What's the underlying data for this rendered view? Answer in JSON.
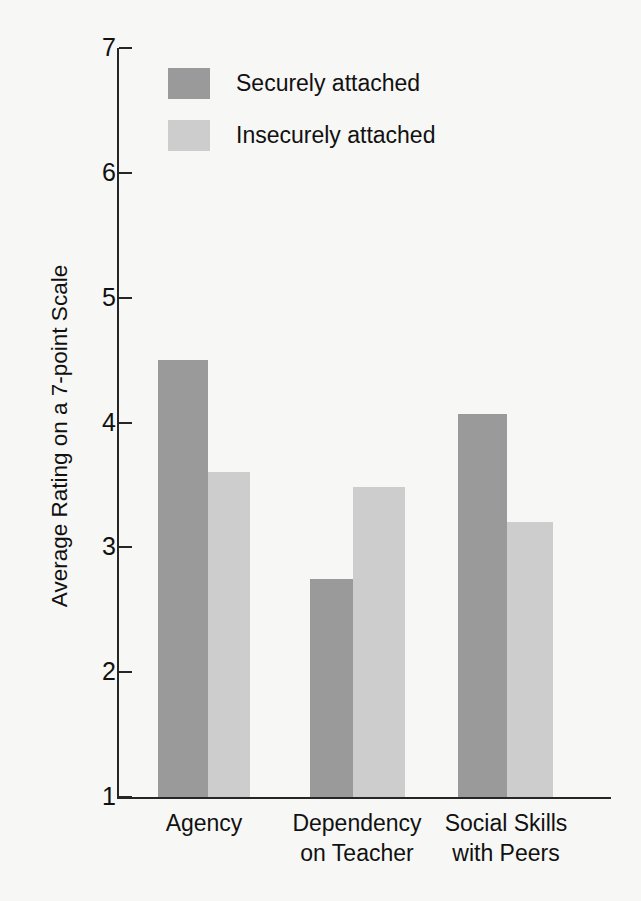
{
  "chart_data": {
    "type": "bar",
    "title": "",
    "xlabel": "",
    "ylabel": "Average Rating on a 7-point Scale",
    "categories": [
      "Agency",
      "Dependency on Teacher",
      "Social Skills with Peers"
    ],
    "category_lines": [
      [
        "Agency",
        ""
      ],
      [
        "Dependency",
        "on Teacher"
      ],
      [
        "Social Skills",
        "with Peers"
      ]
    ],
    "series": [
      {
        "name": "Securely attached",
        "color": "#9a9a9a",
        "values": [
          4.5,
          2.75,
          4.07
        ]
      },
      {
        "name": "Insecurely attached",
        "color": "#cdcdcd",
        "values": [
          3.6,
          3.48,
          3.2
        ]
      }
    ],
    "ylim": [
      1,
      7
    ],
    "yticks": [
      1,
      2,
      3,
      4,
      5,
      6,
      7
    ],
    "ytick_labels": [
      "1",
      "2",
      "3",
      "4",
      "5",
      "6",
      "7"
    ],
    "grid": false,
    "legend_position": "top-left-inside"
  },
  "legend": {
    "items": [
      {
        "label": "Securely attached",
        "swatch": "legend-swatch-secure",
        "color": "#9a9a9a"
      },
      {
        "label": "Insecurely attached",
        "swatch": "legend-swatch-insecure",
        "color": "#cdcdcd"
      }
    ]
  },
  "axes": {
    "y_title": "Average Rating on a 7-point Scale",
    "y_ticks": [
      "7",
      "6",
      "5",
      "4",
      "3",
      "2",
      "1"
    ]
  },
  "colors": {
    "background": "#f7f7f5",
    "axis": "#262626",
    "text": "#111111",
    "series_secure": "#9a9a9a",
    "series_insecure": "#cdcdcd"
  }
}
